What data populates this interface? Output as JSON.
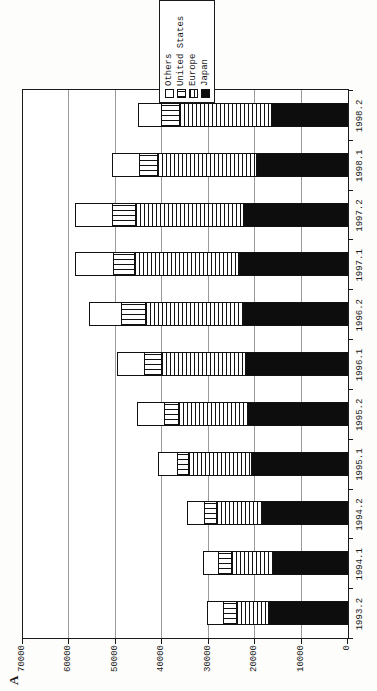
{
  "figure": {
    "panel_label": "A",
    "axis_title": "million US$"
  },
  "chart_data": {
    "type": "bar",
    "subtype": "stacked-vertical",
    "layout_hint": "entire chart rotated 90 degrees counterclockwise on the page; grid on; legend box at right overlapping plot border; monospace typewriter-style labels",
    "title": "",
    "xlabel": "",
    "ylabel": "million US$",
    "ylim": [
      0,
      70000
    ],
    "ytick_step": 10000,
    "yticks": [
      0,
      10000,
      20000,
      30000,
      40000,
      50000,
      60000,
      70000
    ],
    "categories": [
      "1993.2",
      "1994.1",
      "1994.2",
      "1995.1",
      "1995.2",
      "1996.1",
      "1996.2",
      "1997.1",
      "1997.2",
      "1998.1",
      "1998.2"
    ],
    "stack_order_bottom_to_top": [
      "Japan",
      "Europe",
      "United States",
      "Others"
    ],
    "series": [
      {
        "name": "Japan",
        "pattern": "solid-black",
        "values": [
          17100,
          16100,
          18400,
          20600,
          21500,
          21900,
          22300,
          23400,
          22300,
          19600,
          16300
        ]
      },
      {
        "name": "Europe",
        "pattern": "horizontal-stripes",
        "values": [
          6700,
          8800,
          9900,
          13600,
          14900,
          18100,
          21100,
          22400,
          23300,
          21400,
          19800
        ]
      },
      {
        "name": "United States",
        "pattern": "vertical-stripes",
        "values": [
          3000,
          2800,
          2600,
          2400,
          3000,
          3700,
          5200,
          4700,
          5000,
          3700,
          3900
        ]
      },
      {
        "name": "Others",
        "pattern": "white",
        "values": [
          3400,
          3400,
          3500,
          4100,
          5800,
          5800,
          6900,
          8000,
          8000,
          6000,
          5000
        ]
      }
    ],
    "legend": {
      "entries_top_to_bottom": [
        "Others",
        "United States",
        "Europe",
        "Japan"
      ]
    },
    "colors": {
      "ink": "#1a1a1a",
      "gridline": "#9a9a96",
      "background": "#ffffff"
    }
  }
}
